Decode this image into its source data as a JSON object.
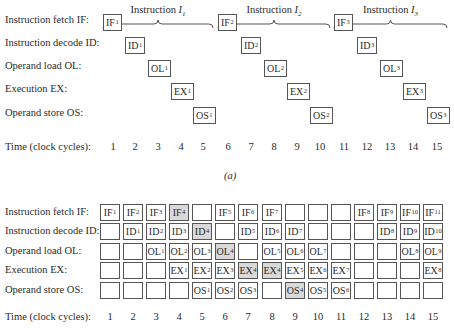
{
  "part_a": {
    "instructions": [
      {
        "title": "Instruction",
        "sub": "1"
      },
      {
        "title": "Instruction",
        "sub": "2"
      },
      {
        "title": "Instruction",
        "sub": "3"
      }
    ],
    "stage_labels": [
      "Instruction fetch IF:",
      "Instruction decode ID:",
      "Operand load OL:",
      "Execution EX:",
      "Operand store OS:"
    ],
    "stages": [
      "IF",
      "ID",
      "OL",
      "EX",
      "OS"
    ],
    "time_label": "Time (clock cycles):",
    "times": [
      "1",
      "2",
      "3",
      "4",
      "5",
      "6",
      "7",
      "8",
      "9",
      "10",
      "11",
      "12",
      "13",
      "14",
      "15"
    ],
    "boxes": [
      {
        "stage": 0,
        "cycle": 1,
        "text": "IF",
        "sub": "1"
      },
      {
        "stage": 1,
        "cycle": 2,
        "text": "ID",
        "sub": "1"
      },
      {
        "stage": 2,
        "cycle": 3,
        "text": "OL",
        "sub": "1"
      },
      {
        "stage": 3,
        "cycle": 4,
        "text": "EX",
        "sub": "1"
      },
      {
        "stage": 4,
        "cycle": 5,
        "text": "OS",
        "sub": "1"
      },
      {
        "stage": 0,
        "cycle": 6,
        "text": "IF",
        "sub": "2"
      },
      {
        "stage": 1,
        "cycle": 7,
        "text": "ID",
        "sub": "2"
      },
      {
        "stage": 2,
        "cycle": 8,
        "text": "OL",
        "sub": "2"
      },
      {
        "stage": 3,
        "cycle": 9,
        "text": "EX",
        "sub": "2"
      },
      {
        "stage": 4,
        "cycle": 10,
        "text": "OS",
        "sub": "2"
      },
      {
        "stage": 0,
        "cycle": 11,
        "text": "IF",
        "sub": "3"
      },
      {
        "stage": 1,
        "cycle": 12,
        "text": "ID",
        "sub": "3"
      },
      {
        "stage": 2,
        "cycle": 13,
        "text": "OL",
        "sub": "3"
      },
      {
        "stage": 3,
        "cycle": 14,
        "text": "EX",
        "sub": "3"
      },
      {
        "stage": 4,
        "cycle": 15,
        "text": "OS",
        "sub": "3"
      }
    ],
    "caption": "(a)"
  },
  "part_b": {
    "stage_labels": [
      "Instruction fetch IF:",
      "Instruction decode ID:",
      "Operand load OL:",
      "Execution EX:",
      "Operand store OS:"
    ],
    "time_label": "Time (clock cycles):",
    "times": [
      "1",
      "2",
      "3",
      "4",
      "5",
      "6",
      "7",
      "8",
      "9",
      "10",
      "11",
      "12",
      "13",
      "14",
      "15"
    ],
    "grid": [
      [
        [
          "IF",
          "1",
          0
        ],
        [
          "IF",
          "2",
          0
        ],
        [
          "IF",
          "3",
          0
        ],
        [
          "IF",
          "4",
          1
        ],
        [
          "",
          "",
          0
        ],
        [
          "IF",
          "5",
          0
        ],
        [
          "IF",
          "6",
          0
        ],
        [
          "IF",
          "7",
          0
        ],
        [
          "",
          "",
          0
        ],
        [
          "",
          "",
          0
        ],
        [
          "",
          "",
          0
        ],
        [
          "IF",
          "8",
          0
        ],
        [
          "IF",
          "9",
          0
        ],
        [
          "IF",
          "10",
          0
        ],
        [
          "IF",
          "11",
          0
        ]
      ],
      [
        [
          "",
          "",
          0
        ],
        [
          "ID",
          "1",
          0
        ],
        [
          "ID",
          "2",
          0
        ],
        [
          "ID",
          "3",
          0
        ],
        [
          "ID",
          "4",
          1
        ],
        [
          "",
          "",
          0
        ],
        [
          "ID",
          "5",
          0
        ],
        [
          "ID",
          "6",
          0
        ],
        [
          "ID",
          "7",
          0
        ],
        [
          "",
          "",
          0
        ],
        [
          "",
          "",
          0
        ],
        [
          "",
          "",
          0
        ],
        [
          "ID",
          "8",
          0
        ],
        [
          "ID",
          "9",
          0
        ],
        [
          "ID",
          "10",
          0
        ]
      ],
      [
        [
          "",
          "",
          0
        ],
        [
          "",
          "",
          0
        ],
        [
          "OL",
          "1",
          0
        ],
        [
          "OL",
          "2",
          0
        ],
        [
          "OL",
          "3",
          0
        ],
        [
          "OL",
          "4",
          1
        ],
        [
          "",
          "",
          0
        ],
        [
          "OL",
          "5",
          0
        ],
        [
          "OL",
          "6",
          0
        ],
        [
          "OL",
          "7",
          0
        ],
        [
          "",
          "",
          0
        ],
        [
          "",
          "",
          0
        ],
        [
          "",
          "",
          0
        ],
        [
          "OL",
          "8",
          0
        ],
        [
          "OL",
          "9",
          0
        ]
      ],
      [
        [
          "",
          "",
          0
        ],
        [
          "",
          "",
          0
        ],
        [
          "",
          "",
          0
        ],
        [
          "EX",
          "1",
          0
        ],
        [
          "EX",
          "2",
          0
        ],
        [
          "EX",
          "3",
          0
        ],
        [
          "EX",
          "4",
          1
        ],
        [
          "EX",
          "4",
          1
        ],
        [
          "EX",
          "5",
          0
        ],
        [
          "EX",
          "6",
          0
        ],
        [
          "EX",
          "7",
          0
        ],
        [
          "",
          "",
          0
        ],
        [
          "",
          "",
          0
        ],
        [
          "",
          "",
          0
        ],
        [
          "EX",
          "8",
          0
        ]
      ],
      [
        [
          "",
          "",
          0
        ],
        [
          "",
          "",
          0
        ],
        [
          "",
          "",
          0
        ],
        [
          "",
          "",
          0
        ],
        [
          "OS",
          "1",
          0
        ],
        [
          "OS",
          "2",
          0
        ],
        [
          "OS",
          "3",
          0
        ],
        [
          "",
          "",
          0
        ],
        [
          "OS",
          "4",
          1
        ],
        [
          "OS",
          "5",
          0
        ],
        [
          "OS",
          "6",
          0
        ],
        [
          "",
          "",
          0
        ],
        [
          "",
          "",
          0
        ],
        [
          "",
          "",
          0
        ],
        [
          "",
          "",
          0
        ]
      ]
    ],
    "shade_color": "#d9d9d9"
  }
}
